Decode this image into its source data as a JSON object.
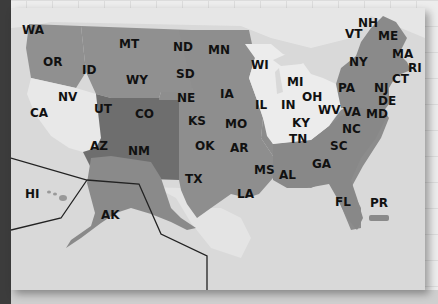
{
  "map": {
    "title": "United States",
    "colors": {
      "ocean": "#d8d8d8",
      "canada": "#e4e4e4",
      "light_state": "#ebebeb",
      "medium_state": "#8e8e8e",
      "dark_state": "#6e6e6e",
      "border": "#555555",
      "inset_line": "#222222"
    },
    "states": [
      {
        "abbr": "WA",
        "x": 22,
        "y": 24,
        "shade": "medium"
      },
      {
        "abbr": "OR",
        "x": 43,
        "y": 56,
        "shade": "medium"
      },
      {
        "abbr": "ID",
        "x": 82,
        "y": 64,
        "shade": "medium"
      },
      {
        "abbr": "MT",
        "x": 119,
        "y": 38,
        "shade": "medium"
      },
      {
        "abbr": "WY",
        "x": 126,
        "y": 74,
        "shade": "medium"
      },
      {
        "abbr": "NV",
        "x": 58,
        "y": 91,
        "shade": "light"
      },
      {
        "abbr": "CA",
        "x": 30,
        "y": 107,
        "shade": "light"
      },
      {
        "abbr": "UT",
        "x": 94,
        "y": 103,
        "shade": "dark"
      },
      {
        "abbr": "CO",
        "x": 135,
        "y": 108,
        "shade": "dark"
      },
      {
        "abbr": "AZ",
        "x": 90,
        "y": 140,
        "shade": "dark"
      },
      {
        "abbr": "NM",
        "x": 128,
        "y": 145,
        "shade": "dark"
      },
      {
        "abbr": "ND",
        "x": 173,
        "y": 41,
        "shade": "medium"
      },
      {
        "abbr": "SD",
        "x": 176,
        "y": 68,
        "shade": "medium"
      },
      {
        "abbr": "NE",
        "x": 177,
        "y": 92,
        "shade": "medium"
      },
      {
        "abbr": "KS",
        "x": 188,
        "y": 115,
        "shade": "medium"
      },
      {
        "abbr": "OK",
        "x": 195,
        "y": 140,
        "shade": "medium"
      },
      {
        "abbr": "TX",
        "x": 185,
        "y": 173,
        "shade": "medium"
      },
      {
        "abbr": "MN",
        "x": 208,
        "y": 44,
        "shade": "medium"
      },
      {
        "abbr": "IA",
        "x": 220,
        "y": 88,
        "shade": "medium"
      },
      {
        "abbr": "MO",
        "x": 225,
        "y": 118,
        "shade": "medium"
      },
      {
        "abbr": "AR",
        "x": 230,
        "y": 142,
        "shade": "medium"
      },
      {
        "abbr": "LA",
        "x": 237,
        "y": 188,
        "shade": "medium"
      },
      {
        "abbr": "MS",
        "x": 254,
        "y": 164,
        "shade": "medium"
      },
      {
        "abbr": "AL",
        "x": 279,
        "y": 169,
        "shade": "medium"
      },
      {
        "abbr": "WI",
        "x": 251,
        "y": 59,
        "shade": "light"
      },
      {
        "abbr": "MI",
        "x": 287,
        "y": 76,
        "shade": "light"
      },
      {
        "abbr": "IL",
        "x": 255,
        "y": 99,
        "shade": "light"
      },
      {
        "abbr": "IN",
        "x": 281,
        "y": 99,
        "shade": "light"
      },
      {
        "abbr": "OH",
        "x": 302,
        "y": 91,
        "shade": "light"
      },
      {
        "abbr": "KY",
        "x": 292,
        "y": 117,
        "shade": "light"
      },
      {
        "abbr": "TN",
        "x": 289,
        "y": 133,
        "shade": "light"
      },
      {
        "abbr": "WV",
        "x": 318,
        "y": 104,
        "shade": "light"
      },
      {
        "abbr": "GA",
        "x": 312,
        "y": 158,
        "shade": "medium"
      },
      {
        "abbr": "SC",
        "x": 330,
        "y": 140,
        "shade": "medium"
      },
      {
        "abbr": "NC",
        "x": 342,
        "y": 123,
        "shade": "medium"
      },
      {
        "abbr": "VA",
        "x": 343,
        "y": 106,
        "shade": "medium"
      },
      {
        "abbr": "FL",
        "x": 335,
        "y": 196,
        "shade": "medium"
      },
      {
        "abbr": "PA",
        "x": 338,
        "y": 82,
        "shade": "medium"
      },
      {
        "abbr": "NY",
        "x": 349,
        "y": 56,
        "shade": "medium"
      },
      {
        "abbr": "VT",
        "x": 345,
        "y": 28,
        "shade": "medium"
      },
      {
        "abbr": "NH",
        "x": 358,
        "y": 17,
        "shade": "medium"
      },
      {
        "abbr": "ME",
        "x": 378,
        "y": 30,
        "shade": "medium"
      },
      {
        "abbr": "MA",
        "x": 392,
        "y": 48,
        "shade": "medium"
      },
      {
        "abbr": "RI",
        "x": 408,
        "y": 62,
        "shade": "medium"
      },
      {
        "abbr": "CT",
        "x": 392,
        "y": 73,
        "shade": "medium"
      },
      {
        "abbr": "NJ",
        "x": 374,
        "y": 82,
        "shade": "medium"
      },
      {
        "abbr": "DE",
        "x": 378,
        "y": 95,
        "shade": "medium"
      },
      {
        "abbr": "MD",
        "x": 366,
        "y": 108,
        "shade": "medium"
      },
      {
        "abbr": "HI",
        "x": 25,
        "y": 188,
        "shade": "light"
      },
      {
        "abbr": "AK",
        "x": 101,
        "y": 209,
        "shade": "medium"
      },
      {
        "abbr": "PR",
        "x": 370,
        "y": 197,
        "shade": "medium"
      }
    ]
  }
}
